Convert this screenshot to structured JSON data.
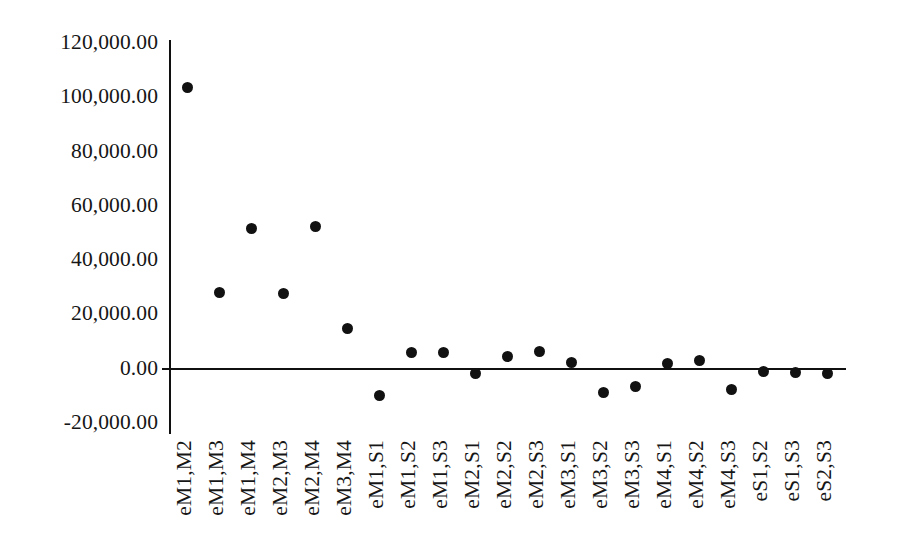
{
  "chart_data": {
    "type": "scatter",
    "title": "",
    "subtitle": "",
    "xlabel": "",
    "ylabel": "",
    "grid": false,
    "legend": false,
    "marker": {
      "shape": "circle",
      "color": "#111111",
      "size_px": 11
    },
    "axis_color": "#101010",
    "ylim": [
      -20000,
      120000
    ],
    "ytick_values": [
      120000,
      100000,
      80000,
      60000,
      40000,
      20000,
      0,
      -20000
    ],
    "ytick_labels": [
      "120,000.00",
      "100,000.00",
      "80,000.00",
      "60,000.00",
      "40,000.00",
      "20,000.00",
      "0.00",
      "-20,000.00"
    ],
    "categories": [
      "eM1,M2",
      "eM1,M3",
      "eM1,M4",
      "eM2,M3",
      "eM2,M4",
      "eM3,M4",
      "eM1,S1",
      "eM1,S2",
      "eM1,S3",
      "eM2,S1",
      "eM2,S2",
      "eM2,S3",
      "eM3,S1",
      "eM3,S2",
      "eM3,S3",
      "eM4,S1",
      "eM4,S2",
      "eM4,S3",
      "eS1,S2",
      "eS1,S3",
      "eS2,S3"
    ],
    "values": [
      103500,
      28000,
      51500,
      27600,
      52300,
      14700,
      -9900,
      5900,
      5800,
      -1800,
      4400,
      6300,
      2200,
      -8800,
      -6600,
      1800,
      2900,
      -7700,
      -1100,
      -1300,
      -1800
    ],
    "points": [
      {
        "category": "eM1,M2",
        "value": 103500
      },
      {
        "category": "eM1,M3",
        "value": 28000
      },
      {
        "category": "eM1,M4",
        "value": 51500
      },
      {
        "category": "eM2,M3",
        "value": 27600
      },
      {
        "category": "eM2,M4",
        "value": 52300
      },
      {
        "category": "eM3,M4",
        "value": 14700
      },
      {
        "category": "eM1,S1",
        "value": -9900
      },
      {
        "category": "eM1,S2",
        "value": 5900
      },
      {
        "category": "eM1,S3",
        "value": 5800
      },
      {
        "category": "eM2,S1",
        "value": -1800
      },
      {
        "category": "eM2,S2",
        "value": 4400
      },
      {
        "category": "eM2,S3",
        "value": 6300
      },
      {
        "category": "eM3,S1",
        "value": 2200
      },
      {
        "category": "eM3,S2",
        "value": -8800
      },
      {
        "category": "eM3,S3",
        "value": -6600
      },
      {
        "category": "eM4,S1",
        "value": 1800
      },
      {
        "category": "eM4,S2",
        "value": 2900
      },
      {
        "category": "eM4,S3",
        "value": -7700
      },
      {
        "category": "eS1,S2",
        "value": -1100
      },
      {
        "category": "eS1,S3",
        "value": -1300
      },
      {
        "category": "eS2,S3",
        "value": -1800
      }
    ]
  },
  "geometry": {
    "y_top_px": 43,
    "y_bottom_px": 423,
    "y_top_value": 120000,
    "y_bottom_value": -20000,
    "x_first_px": 187,
    "x_step_px": 32.0
  }
}
